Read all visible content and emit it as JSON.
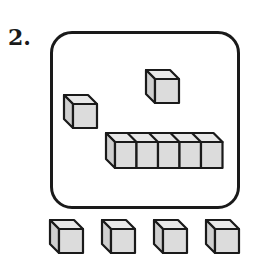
{
  "problem": {
    "number_label": "2.",
    "colors": {
      "stroke": "#1a1a1a",
      "front": "#dcdcdc",
      "top": "#e8e8e8",
      "side": "#cfcfcf"
    },
    "inside_box": {
      "single_cubes": [
        {
          "x": 64,
          "y": 95
        },
        {
          "x": 146,
          "y": 70
        }
      ],
      "ten_rod_partial": {
        "x": 106,
        "y": 133,
        "cubes": 5
      }
    },
    "below_box": {
      "single_cubes": [
        {
          "x": 50,
          "y": 220
        },
        {
          "x": 102,
          "y": 220
        },
        {
          "x": 154,
          "y": 220
        },
        {
          "x": 206,
          "y": 220
        }
      ]
    }
  }
}
